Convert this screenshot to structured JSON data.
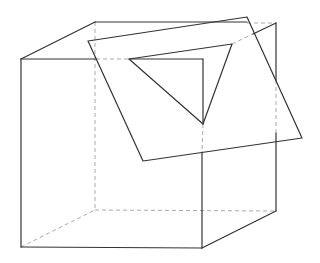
{
  "diagram": {
    "title": "",
    "colors": {
      "line": "#333333",
      "hidden": "#aaaaaa",
      "background": "#ffffff"
    },
    "cube": {
      "front_top_left": [
        21,
        59
      ],
      "front_top_right": [
        203,
        59
      ],
      "front_bottom_right": [
        202,
        248
      ],
      "front_bottom_left": [
        21,
        247
      ],
      "back_top_left": [
        95,
        22
      ],
      "back_top_right": [
        276,
        23
      ],
      "back_bottom_right": [
        276,
        211
      ],
      "back_bottom_left": [
        95,
        210
      ]
    },
    "plane": [
      [
        88,
        41
      ],
      [
        247,
        17
      ],
      [
        302,
        138
      ],
      [
        143,
        161
      ]
    ],
    "triangle_section": [
      [
        129,
        59
      ],
      [
        232,
        44
      ],
      [
        203,
        124
      ]
    ]
  }
}
